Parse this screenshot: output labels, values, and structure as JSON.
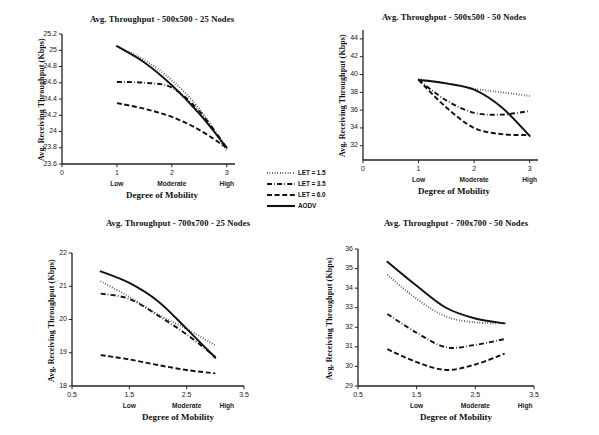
{
  "figure": {
    "background": "#ffffff",
    "ink": "#111111"
  },
  "legend": {
    "position": "center-middle",
    "entries": [
      {
        "label": "LET = 1.5",
        "style": "dotted"
      },
      {
        "label": "LET = 3.5",
        "style": "dash-dot"
      },
      {
        "label": "LET = 6.0",
        "style": "dashed"
      },
      {
        "label": "AODV",
        "style": "solid"
      }
    ]
  },
  "chart_data": [
    {
      "id": "tl",
      "type": "line",
      "title": "Avg. Throughput - 500x500 - 25 Nodes",
      "xlabel": "Degree of Mobility",
      "ylabel": "Avg. Receiving Throughput (Kbps)",
      "xlim": [
        0,
        3.15
      ],
      "ylim": [
        23.6,
        25.2
      ],
      "xticks": [
        0,
        1,
        2,
        3
      ],
      "xticklabels": [
        "0",
        "1",
        "2",
        "3"
      ],
      "category_ticks": [
        1,
        2,
        3
      ],
      "category_labels": [
        "Low",
        "Moderate",
        "High"
      ],
      "yticks": [
        23.6,
        23.8,
        24,
        24.2,
        24.4,
        24.6,
        24.8,
        25,
        25.2
      ],
      "yticklabels": [
        "23.6",
        "23.8",
        "24",
        "24.2",
        "24.4",
        "24.6",
        "24.8",
        "25",
        "25.2"
      ],
      "grid": false,
      "x": [
        1,
        1.5,
        2,
        2.5,
        3
      ],
      "series": [
        {
          "name": "LET = 1.5",
          "style": "dotted",
          "values": [
            25.05,
            24.88,
            24.63,
            24.28,
            23.76
          ]
        },
        {
          "name": "LET = 3.5",
          "style": "dash-dot",
          "values": [
            24.61,
            24.6,
            24.54,
            24.25,
            23.8
          ]
        },
        {
          "name": "LET = 6.0",
          "style": "dashed",
          "values": [
            24.35,
            24.28,
            24.18,
            24.02,
            23.8
          ]
        },
        {
          "name": "AODV",
          "style": "solid",
          "values": [
            25.05,
            24.85,
            24.57,
            24.22,
            23.8
          ]
        }
      ]
    },
    {
      "id": "tr",
      "type": "line",
      "title": "Avg. Throughput - 500x500 - 50 Nodes",
      "xlabel": "Degree of Mobility",
      "ylabel": "Avg. Receiving Throughput (Kbps)",
      "xlim": [
        0,
        3.15
      ],
      "ylim": [
        30.4,
        45
      ],
      "xticks": [
        0,
        1,
        2,
        3
      ],
      "xticklabels": [
        "0",
        "1",
        "2",
        "3"
      ],
      "category_ticks": [
        1,
        2,
        3
      ],
      "category_labels": [
        "Low",
        "Moderate",
        "High"
      ],
      "yticks": [
        32,
        34,
        36,
        38,
        40,
        42,
        44
      ],
      "yticklabels": [
        "32",
        "34",
        "36",
        "38",
        "40",
        "42",
        "44"
      ],
      "grid": false,
      "x": [
        1,
        1.5,
        2,
        2.5,
        3
      ],
      "series": [
        {
          "name": "LET = 1.5",
          "style": "dotted",
          "values": [
            39.5,
            39.0,
            38.4,
            38.0,
            37.6
          ]
        },
        {
          "name": "LET = 3.5",
          "style": "dash-dot",
          "values": [
            39.4,
            37.1,
            35.7,
            35.5,
            35.9
          ]
        },
        {
          "name": "LET = 6.0",
          "style": "dashed",
          "values": [
            39.4,
            36.3,
            34.0,
            33.3,
            33.2
          ]
        },
        {
          "name": "AODV",
          "style": "solid",
          "values": [
            39.4,
            39.0,
            38.3,
            36.3,
            33.1
          ]
        }
      ]
    },
    {
      "id": "bl",
      "type": "line",
      "title": "Avg. Throughput - 700x700 - 25 Nodes",
      "xlabel": "Degree of Mobility",
      "ylabel": "Avg. Receiving Throughput (Kbps)",
      "xlim": [
        0.5,
        3.5
      ],
      "ylim": [
        18,
        22
      ],
      "xticks": [
        0.5,
        1.5,
        2.5,
        3.5
      ],
      "xticklabels": [
        "0.5",
        "1.5",
        "2.5",
        "3.5"
      ],
      "category_ticks": [
        1.5,
        2.5,
        3.2
      ],
      "category_labels": [
        "Low",
        "Moderate",
        "High"
      ],
      "yticks": [
        18,
        19,
        20,
        21,
        22
      ],
      "yticklabels": [
        "18",
        "19",
        "20",
        "21",
        "22"
      ],
      "grid": false,
      "x": [
        1,
        1.5,
        2,
        2.5,
        3
      ],
      "series": [
        {
          "name": "LET = 1.5",
          "style": "dotted",
          "values": [
            21.15,
            20.68,
            20.15,
            19.72,
            19.22
          ]
        },
        {
          "name": "LET = 3.5",
          "style": "dash-dot",
          "values": [
            20.78,
            20.62,
            20.12,
            19.55,
            18.88
          ]
        },
        {
          "name": "LET = 6.0",
          "style": "dashed",
          "values": [
            18.93,
            18.8,
            18.63,
            18.48,
            18.38
          ]
        },
        {
          "name": "AODV",
          "style": "solid",
          "values": [
            21.45,
            21.1,
            20.55,
            19.72,
            18.85
          ]
        }
      ]
    },
    {
      "id": "br",
      "type": "line",
      "title": "Avg. Throughput - 700x700 - 50 Nodes",
      "xlabel": "Degree of Mobility",
      "ylabel": "Avg. Receiving Throughput (Kbps)",
      "xlim": [
        0.5,
        3.5
      ],
      "ylim": [
        29,
        36
      ],
      "xticks": [
        0.5,
        1.5,
        2.5,
        3.5
      ],
      "xticklabels": [
        "0.5",
        "1.5",
        "2.5",
        "3.5"
      ],
      "category_ticks": [
        1.5,
        2.5,
        3.35
      ],
      "category_labels": [
        "Low",
        "Moderate",
        "High"
      ],
      "yticks": [
        29,
        30,
        31,
        32,
        33,
        34,
        35,
        36
      ],
      "yticklabels": [
        "29",
        "30",
        "31",
        "32",
        "33",
        "34",
        "35",
        "36"
      ],
      "grid": false,
      "x": [
        1,
        1.5,
        2,
        2.5,
        3
      ],
      "series": [
        {
          "name": "LET = 1.5",
          "style": "dotted",
          "values": [
            34.68,
            33.45,
            32.55,
            32.25,
            32.2
          ]
        },
        {
          "name": "LET = 3.5",
          "style": "dash-dot",
          "values": [
            32.68,
            31.72,
            30.98,
            31.1,
            31.4
          ]
        },
        {
          "name": "LET = 6.0",
          "style": "dashed",
          "values": [
            30.88,
            30.22,
            29.82,
            30.1,
            30.65
          ]
        },
        {
          "name": "AODV",
          "style": "solid",
          "values": [
            35.35,
            34.12,
            33.0,
            32.45,
            32.2
          ]
        }
      ]
    }
  ]
}
